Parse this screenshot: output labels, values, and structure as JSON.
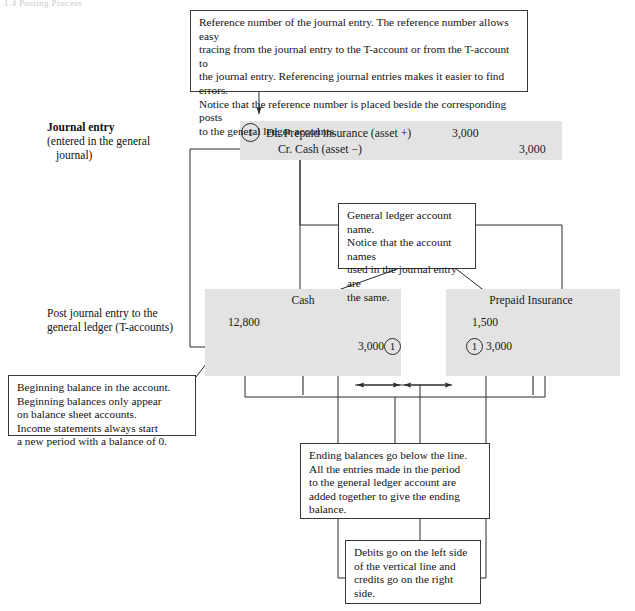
{
  "page": {
    "header_fragment": "1.4 Posting Process"
  },
  "callouts": {
    "reference_number": {
      "lines": [
        "Reference number of the journal entry. The reference number allows easy",
        "tracing from the journal entry to the T-account or from the T-account to",
        "the journal entry. Referencing journal entries makes it easier to find errors.",
        "Notice that the reference number is placed beside the corresponding posts",
        "to the general ledger accounts."
      ]
    },
    "account_name": {
      "lines": [
        "General ledger account name.",
        "Notice that the account names",
        "used in the journal entry are",
        "the same."
      ]
    },
    "beginning_balance": {
      "lines": [
        "Beginning balance in the account.",
        "Beginning balances only appear",
        "on balance sheet accounts.",
        "Income statements always start",
        "a new period with a balance of 0."
      ]
    },
    "ending_balance": {
      "lines": [
        "Ending balances go below the line.",
        "All the entries made in the period",
        "to the general ledger account are",
        "added together to give the ending",
        "balance."
      ]
    },
    "debits_credits": {
      "lines": [
        "Debits go on the left side",
        "of the vertical line and",
        "credits go on the right",
        "side."
      ]
    }
  },
  "side_labels": {
    "journal_entry": {
      "title": "Journal entry",
      "line2": "(entered in the general",
      "line3": "journal)"
    },
    "posting": {
      "line1": "Post journal entry to the",
      "line2": "general ledger (T-accounts)"
    }
  },
  "journal_entry": {
    "ref": "1",
    "debit_line": "Dr. Prepaid insurance (asset +)",
    "debit_amount": "3,000",
    "credit_line": "Cr. Cash (asset −)",
    "credit_amount": "3,000"
  },
  "t_accounts": [
    {
      "name": "Cash",
      "beginning_balance": "12,800",
      "entry_amount": "3,000",
      "entry_side": "credit",
      "entry_ref": "1"
    },
    {
      "name": "Prepaid Insurance",
      "beginning_balance": "1,500",
      "entry_amount": "3,000",
      "entry_side": "debit",
      "entry_ref": "1"
    }
  ],
  "colors": {
    "panel_gray": "#e3e3e3",
    "line": "#2b2b2b",
    "text": "#141414",
    "page_bg": "#ffffff"
  }
}
